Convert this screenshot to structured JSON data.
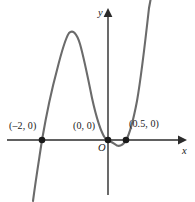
{
  "figure": {
    "name": "quartic-polynomial-graph",
    "width": 195,
    "height": 202,
    "background_color": "#ffffff",
    "curve_color": "#6b6b6b",
    "axis_color": "#2b2b2b",
    "point_color": "#1a1a1a",
    "label_color": "#1a1a1a"
  },
  "axes": {
    "x_label": "x",
    "y_label": "y",
    "origin_label": "O"
  },
  "labels": {
    "root_left": "(–2, 0)",
    "root_origin": "(0, 0)",
    "root_right": "(0.5, 0)"
  },
  "chart_data": {
    "type": "line",
    "title": "",
    "xlabel": "x",
    "ylabel": "y",
    "grid": false,
    "legend": false,
    "axis_arrows": [
      "x-positive",
      "y-positive"
    ],
    "curve_description": "Quartic polynomial with x-intercepts at x = -2, x = 0 (tangential touch from above then dip), and x = 0.5; opens upward on both ends with a local maximum between x = -2 and x = 0 and a shallow local minimum between x = 0 and x = 0.5.",
    "roots": [
      {
        "label": "(–2, 0)",
        "x": -2,
        "y": 0
      },
      {
        "label": "(0, 0)",
        "x": 0,
        "y": 0
      },
      {
        "label": "(0.5, 0)",
        "x": 0.5,
        "y": 0
      }
    ],
    "marked_points": [
      {
        "x": -2,
        "y": 0
      },
      {
        "x": 0,
        "y": 0
      },
      {
        "x": 0.5,
        "y": 0
      }
    ],
    "local_extrema": [
      {
        "type": "maximum",
        "x": -1.3,
        "y": 2.9
      },
      {
        "type": "minimum",
        "x": 0.3,
        "y": -0.25
      }
    ],
    "xlim": [
      -2.6,
      1.0
    ],
    "ylim": [
      -4.0,
      4.6
    ],
    "x": [
      -2.45,
      -2.3,
      -2.15,
      -2.0,
      -1.85,
      -1.7,
      -1.55,
      -1.4,
      -1.3,
      -1.15,
      -1.0,
      -0.85,
      -0.7,
      -0.55,
      -0.4,
      -0.25,
      -0.1,
      0.0,
      0.1,
      0.2,
      0.3,
      0.4,
      0.5,
      0.6,
      0.7,
      0.8,
      0.9
    ],
    "y": [
      -4.0,
      -2.35,
      -1.05,
      0.0,
      0.8,
      1.6,
      2.3,
      2.75,
      2.9,
      2.8,
      2.5,
      2.1,
      1.6,
      1.1,
      0.65,
      0.3,
      0.05,
      0.0,
      -0.15,
      -0.24,
      -0.26,
      -0.17,
      0.0,
      0.55,
      1.45,
      2.8,
      4.6
    ]
  }
}
